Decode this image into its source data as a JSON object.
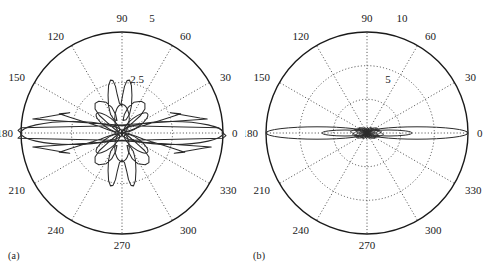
{
  "figure": {
    "background_color": "#ffffff",
    "ink_color": "#1a1a1a",
    "grid_color": "#555555",
    "panels": [
      {
        "caption": "(a)",
        "chart_index": 0
      },
      {
        "caption": "(b)",
        "chart_index": 1
      }
    ]
  },
  "chart_data": [
    {
      "type": "line",
      "subtype": "polar-antenna-pattern",
      "title": "",
      "subtitle": "",
      "panel_label": "(a)",
      "xlabel": "",
      "ylabel": "",
      "grid": true,
      "legend_position": "none",
      "angular_unit": "degrees",
      "angular_tick_labels": [
        "0",
        "30",
        "60",
        "90",
        "120",
        "150",
        "180",
        "210",
        "240",
        "270",
        "300",
        "330"
      ],
      "angular_ticks": [
        0,
        30,
        60,
        90,
        120,
        150,
        180,
        210,
        240,
        270,
        300,
        330
      ],
      "angular_direction": "counterclockwise",
      "angular_zero_at": "east",
      "radial_tick_labels": [
        "2.5",
        "5"
      ],
      "radial_ticks": [
        2.5,
        5
      ],
      "rlim": [
        0,
        5
      ],
      "radial_label_angle_deg": 75,
      "outer_radial_label_angle_deg": 78,
      "beam_count": 2,
      "main_lobe_peak": 5.0,
      "main_lobe_angles_deg": [
        0,
        180
      ],
      "main_lobe_half_width_deg": 22,
      "side_lobe_peak": 1.35,
      "side_lobe_angles_deg": [
        90,
        270
      ],
      "side_lobe_half_width_deg": 13,
      "minor_lobe_peak": 0.85,
      "minor_lobe_angles_deg": [
        35,
        145,
        215,
        325
      ],
      "minor_lobe_half_width_deg": 9,
      "lobe_count_total": 8,
      "series": [
        {
          "name": "array factor",
          "color": "#2b2b2b",
          "theta_deg": [
            0,
            3,
            6,
            9,
            12,
            15,
            18,
            21,
            24,
            27,
            30,
            33,
            36,
            39,
            42,
            45,
            48,
            51,
            54,
            57,
            60,
            63,
            66,
            69,
            72,
            75,
            78,
            81,
            84,
            87,
            90,
            93,
            96,
            99,
            102,
            105,
            108,
            111,
            114,
            117,
            120,
            123,
            126,
            129,
            132,
            135,
            138,
            141,
            144,
            147,
            150,
            153,
            156,
            159,
            162,
            165,
            168,
            171,
            174,
            177,
            180,
            183,
            186,
            189,
            192,
            195,
            198,
            201,
            204,
            207,
            210,
            213,
            216,
            219,
            222,
            225,
            228,
            231,
            234,
            237,
            240,
            243,
            246,
            249,
            252,
            255,
            258,
            261,
            264,
            267,
            270,
            273,
            276,
            279,
            282,
            285,
            288,
            291,
            294,
            297,
            300,
            303,
            306,
            309,
            312,
            315,
            318,
            321,
            324,
            327,
            330,
            333,
            336,
            339,
            342,
            345,
            348,
            351,
            354,
            357
          ],
          "r": [
            5.0,
            4.95,
            4.8,
            4.55,
            4.22,
            3.82,
            3.38,
            2.9,
            2.42,
            1.95,
            1.52,
            1.14,
            0.82,
            0.56,
            0.34,
            0.16,
            0.1,
            0.36,
            0.62,
            0.8,
            0.85,
            0.78,
            0.6,
            0.36,
            0.14,
            0.05,
            0.28,
            0.62,
            0.95,
            1.2,
            1.35,
            1.2,
            0.95,
            0.62,
            0.28,
            0.05,
            0.14,
            0.36,
            0.6,
            0.78,
            0.85,
            0.8,
            0.62,
            0.36,
            0.1,
            0.16,
            0.34,
            0.56,
            0.82,
            1.14,
            1.52,
            1.95,
            2.42,
            2.9,
            3.38,
            3.82,
            4.22,
            4.55,
            4.8,
            4.95,
            5.0,
            4.95,
            4.8,
            4.55,
            4.22,
            3.82,
            3.38,
            2.9,
            2.42,
            1.95,
            1.52,
            1.14,
            0.82,
            0.56,
            0.34,
            0.16,
            0.1,
            0.36,
            0.62,
            0.8,
            0.85,
            0.78,
            0.6,
            0.36,
            0.14,
            0.05,
            0.28,
            0.62,
            0.95,
            1.2,
            1.35,
            1.2,
            0.95,
            0.62,
            0.28,
            0.05,
            0.14,
            0.36,
            0.6,
            0.78,
            0.85,
            0.8,
            0.62,
            0.36,
            0.1,
            0.16,
            0.34,
            0.56,
            0.82,
            1.14,
            1.52,
            1.95,
            2.42,
            2.9,
            3.38,
            3.82,
            4.22,
            4.55,
            4.8,
            4.95
          ]
        }
      ]
    },
    {
      "type": "line",
      "subtype": "polar-antenna-pattern",
      "title": "",
      "subtitle": "",
      "panel_label": "(b)",
      "xlabel": "",
      "ylabel": "",
      "grid": true,
      "legend_position": "none",
      "angular_unit": "degrees",
      "angular_tick_labels": [
        "0",
        "30",
        "60",
        "90",
        "120",
        "150",
        "180",
        "210",
        "240",
        "270",
        "300",
        "330"
      ],
      "angular_ticks": [
        0,
        30,
        60,
        90,
        120,
        150,
        180,
        210,
        240,
        270,
        300,
        330
      ],
      "angular_direction": "counterclockwise",
      "angular_zero_at": "east",
      "radial_tick_labels": [
        "5",
        "10"
      ],
      "radial_ticks": [
        5,
        10
      ],
      "rlim": [
        0,
        10
      ],
      "radial_label_angle_deg": 72,
      "outer_radial_label_angle_deg": 78,
      "beam_count": 2,
      "main_lobe_peak": 10.0,
      "main_lobe_angles_deg": [
        0,
        180
      ],
      "main_lobe_half_width_deg": 7,
      "side_lobe_peak": 1.6,
      "side_lobe_count": 36,
      "side_lobe_envelope": "decaying starburst",
      "lobe_count_total": 72,
      "series": [
        {
          "name": "array factor",
          "color": "#2b2b2b",
          "description": "narrow endfire beams at 0 and 180 degrees with dense low-level sidelobe starburst filling all other angles",
          "samples": 720
        }
      ]
    }
  ]
}
